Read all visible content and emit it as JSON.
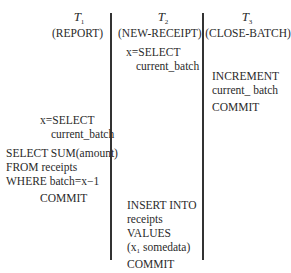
{
  "diagram": {
    "transactions": [
      {
        "name": "T",
        "subscript": "1",
        "label": "(REPORT)",
        "steps": [
          {
            "lines": [
              "x=SELECT",
              "current_batch"
            ]
          },
          {
            "lines": [
              "SELECT SUM(amount)",
              "FROM receipts",
              "WHERE batch=x−1"
            ]
          },
          {
            "lines": [
              "COMMIT"
            ]
          }
        ]
      },
      {
        "name": "T",
        "subscript": "2",
        "label": "(NEW-RECEIPT)",
        "steps": [
          {
            "lines": [
              "x=SELECT",
              "current_batch"
            ]
          },
          {
            "lines": [
              "INSERT INTO",
              "receipts",
              "VALUES",
              "(x",
              "somedata)"
            ],
            "values_subscript": "1"
          },
          {
            "lines": [
              "COMMIT"
            ]
          }
        ]
      },
      {
        "name": "T",
        "subscript": "3",
        "label": "(CLOSE-BATCH)",
        "steps": [
          {
            "lines": [
              "INCREMENT",
              "current_ batch"
            ]
          },
          {
            "lines": [
              "COMMIT"
            ]
          }
        ]
      }
    ],
    "colors": {
      "text": "#2a2a2a",
      "divider": "#333333",
      "background": "#ffffff"
    }
  }
}
